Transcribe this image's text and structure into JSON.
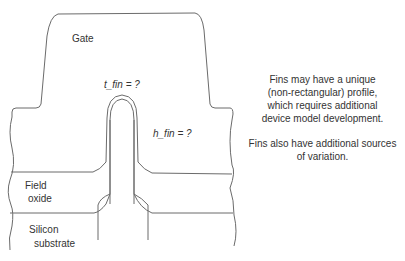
{
  "diagram": {
    "labels": {
      "gate": "Gate",
      "t_fin": "t_fin = ?",
      "h_fin": "h_fin = ?",
      "field_oxide_line1": "Field",
      "field_oxide_line2": "oxide",
      "substrate_line1": "Silicon",
      "substrate_line2": "substrate"
    },
    "notes": {
      "note1_line1": "Fins may have a unique",
      "note1_line2": "(non-rectangular) profile,",
      "note1_line3": "which requires additional",
      "note1_line4": "device model development.",
      "note2_line1": "Fins also have additional sources",
      "note2_line2": "of variation."
    },
    "colors": {
      "stroke": "#6b6b6b",
      "text": "#333333",
      "background": "#ffffff"
    }
  }
}
